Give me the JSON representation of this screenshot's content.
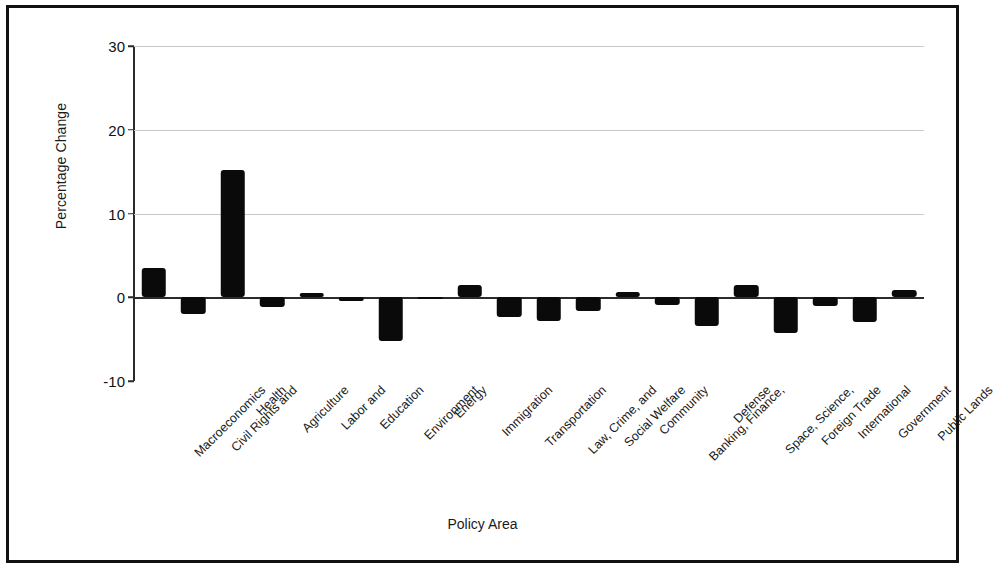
{
  "chart_data": {
    "type": "bar",
    "title": "",
    "xlabel": "Policy Area",
    "ylabel": "Percentage Change",
    "ylim": [
      -10,
      30
    ],
    "yticks": [
      -10,
      0,
      10,
      20,
      30
    ],
    "ytick_labels": [
      "-10",
      "0",
      "10",
      "20",
      "30"
    ],
    "gridlines": [
      10,
      20,
      30
    ],
    "grid": true,
    "legend": null,
    "bar_color": "#0a0a0a",
    "categories": [
      "Macroeconomics",
      "Civil Rights and",
      "Health",
      "Agriculture",
      "Labor and",
      "Education",
      "Environment",
      "Energy",
      "Immigration",
      "Transportation",
      "Law, Crime, and",
      "Social Welfare",
      "Community",
      "Banking, Finance,",
      "Defense",
      "Space, Science,",
      "Foreign Trade",
      "International",
      "Government",
      "Public Lands"
    ],
    "values": [
      3.5,
      -2.0,
      15.2,
      -1.2,
      0.5,
      -0.4,
      -5.2,
      -0.2,
      1.5,
      -2.4,
      -2.8,
      -1.6,
      0.6,
      -0.9,
      -3.4,
      1.5,
      -4.3,
      -1.0,
      -3.0,
      0.9
    ]
  }
}
